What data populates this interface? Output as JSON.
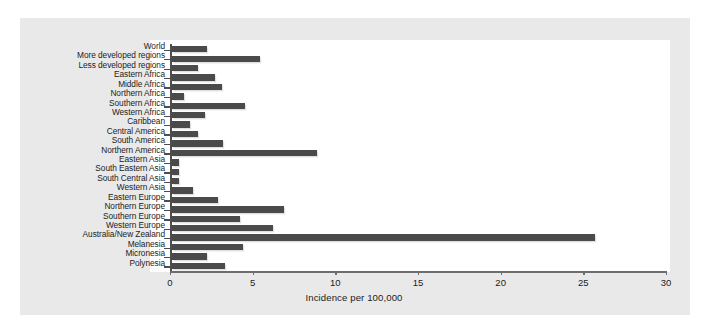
{
  "chart_data": {
    "type": "bar",
    "orientation": "horizontal",
    "title": "",
    "xlabel": "Incidence per 100,000",
    "ylabel": "",
    "xlim": [
      0,
      30
    ],
    "xticks": [
      0,
      5,
      10,
      15,
      20,
      25,
      30
    ],
    "xticklabels": [
      "0",
      "5",
      "10",
      "15",
      "20",
      "25",
      "30"
    ],
    "grid": false,
    "legend": null,
    "bar_color": "#4a4a4a",
    "plot_background": "#ffffff",
    "panel_background": "#e9e9e9",
    "categories": [
      "World",
      "More developed regions",
      "Less developed regions",
      "Eastern Africa",
      "Middle Africa",
      "Northern Africa",
      "Southern Africa",
      "Western Africa",
      "Caribbean",
      "Central America",
      "South America",
      "Northern America",
      "Eastern Asia",
      "South Eastern Asia",
      "South Central Asia",
      "Western Asia",
      "Eastern Europe",
      "Northern Europe",
      "Southern Europe",
      "Western Europe",
      "Australia/New Zealand",
      "Melanesia",
      "Micronesia",
      "Polynesia"
    ],
    "values": [
      2.1,
      5.3,
      1.6,
      2.6,
      3.0,
      0.7,
      4.4,
      2.0,
      1.1,
      1.6,
      3.1,
      8.8,
      0.4,
      0.45,
      0.45,
      1.3,
      2.8,
      6.8,
      4.1,
      6.1,
      25.6,
      4.3,
      2.1,
      3.2
    ]
  }
}
